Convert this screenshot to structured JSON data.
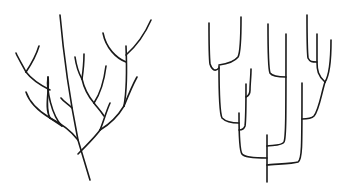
{
  "figure": {
    "panels": [
      {
        "id": "left",
        "label": "Branching tree (natural)",
        "style": "curved-branches",
        "stroke_color": "#1a1a1a",
        "paths": [
          "M60 15 C 64 60, 72 110, 78 140 L 90 180",
          "M78 140 C 72 132, 62 124, 50 118",
          "M50 118 C 44 108, 50 88, 48 77",
          "M50 118 L 62 126",
          "M62 126 C 52 116, 46 90, 48 77",
          "M50 118 C 40 112, 30 104, 26 92",
          "M78 154 C 88 144, 96 136, 100 130",
          "M100 130 C 104 120, 106 112, 110 103",
          "M100 130 C 110 124, 118 116, 124 106",
          "M124 106 C 128 96, 132 86, 137 77",
          "M124 106 C 127 90, 127 70, 126 46",
          "M126 62 C 116 58, 106 48, 103 33",
          "M126 55 C 134 48, 144 36, 151 20",
          "M104 116 C 100 110, 96 106, 94 103",
          "M94 103 C 100 94, 104 82, 106 66",
          "M94 103 C 88 96, 84 88, 82 79",
          "M82 79 C 78 72, 76 64, 75 57",
          "M82 79 C 83 72, 84 62, 84 54",
          "M72 108 C 68 104, 64 102, 61 98",
          "M50 90 C 42 86, 32 80, 26 72",
          "M26 72 C 22 64, 18 58, 16 53",
          "M26 72 C 30 66, 36 56, 39 46"
        ]
      },
      {
        "id": "right",
        "label": "Rectangular cladogram",
        "style": "elbow-branches",
        "stroke_color": "#1a1a1a",
        "paths": [
          "M95 182 L 95 135",
          "M95 165 C 100 164, 120 164, 126 162 C 130 160, 130 150, 130 83",
          "M95 146 C 100 145, 110 146, 112 142 C 114 138, 114 120, 114 34",
          "M114 77 C 108 77, 100 76, 98 73 C 96 68, 96 40, 96 24",
          "M95 158 C 85 158, 72 157, 70 154 C 67 150, 67 130, 67 113",
          "M67 130 C 70 130, 72 129, 73 126 C 74 120, 74 100, 74 84",
          "M74 97 C 76 96, 78 93, 78 90 C 78 84, 79 76, 79 69",
          "M67 123 C 60 123, 54 122, 50 118 C 47 112, 47 90, 47 66",
          "M47 68 C 43 72, 40 70, 38 64 C 37 56, 37 40, 37 23",
          "M47 65 C 55 64, 62 62, 66 57 C 69 52, 69 35, 69 17",
          "M130 119 C 136 119, 140 118, 142 116 C 147 110, 149 95, 153 82",
          "M153 82 C 146 76, 145 70, 145 62 C 145 50, 145 40, 145 34",
          "M145 62 C 140 62, 138 62, 136 58 C 135 50, 135 30, 135 15",
          "M153 82 C 157 76, 159 66, 159 40"
        ]
      }
    ]
  }
}
